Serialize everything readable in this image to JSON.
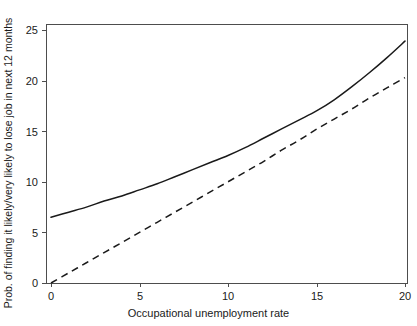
{
  "chart_data": {
    "type": "line",
    "title": "",
    "xlabel": "Occupational unemployment rate",
    "ylabel": "Prob. of finding it likely/very likely to lose job in next 12 months",
    "xlim": [
      0,
      20
    ],
    "ylim": [
      0,
      25.5
    ],
    "xticks": [
      "0",
      "5",
      "10",
      "15",
      "20"
    ],
    "xtick_values": [
      0,
      5,
      10,
      15,
      20
    ],
    "yticks": [
      "0",
      "5",
      "10",
      "15",
      "20",
      "25"
    ],
    "ytick_values": [
      0,
      5,
      10,
      15,
      20,
      25
    ],
    "grid": false,
    "legend": "none",
    "series": [
      {
        "name": "solid-curve",
        "style": "solid",
        "color": "#1a1a1a",
        "x": [
          0,
          1,
          2,
          3,
          4,
          5,
          6,
          7,
          8,
          9,
          10,
          11,
          12,
          13,
          14,
          15,
          16,
          17,
          18,
          19,
          20
        ],
        "values": [
          6.5,
          7.0,
          7.5,
          8.1,
          8.6,
          9.2,
          9.8,
          10.5,
          11.2,
          11.9,
          12.6,
          13.4,
          14.3,
          15.2,
          16.1,
          17.0,
          18.1,
          19.4,
          20.8,
          22.3,
          23.9
        ]
      },
      {
        "name": "dashed-line",
        "style": "dashed",
        "color": "#1a1a1a",
        "x": [
          0,
          1,
          2,
          3,
          4,
          5,
          6,
          7,
          8,
          9,
          10,
          11,
          12,
          13,
          14,
          15,
          16,
          17,
          18,
          19,
          20
        ],
        "values": [
          0.0,
          1.0,
          2.0,
          3.0,
          4.0,
          5.0,
          6.0,
          7.0,
          8.0,
          9.0,
          10.0,
          11.0,
          12.0,
          13.1,
          14.1,
          15.2,
          16.2,
          17.2,
          18.3,
          19.3,
          20.3
        ]
      }
    ]
  },
  "axes": {
    "frame_color": "#4d4d4d",
    "tick_color": "#4d4d4d",
    "text_color": "#1a1a1a"
  }
}
